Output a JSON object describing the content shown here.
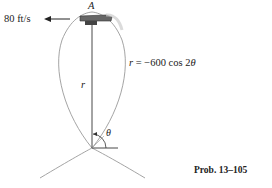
{
  "figure": {
    "velocity_label": "80 ft/s",
    "point_label": "A",
    "radius_label": "r",
    "equation": {
      "lhs": "r",
      "rhs_prefix": " = −600 cos 2",
      "rhs_var": "θ"
    },
    "angle_label": "θ",
    "caption": "Prob. 13–105"
  },
  "colors": {
    "curve": "#9a9a9a",
    "lines": "#333333",
    "plane": "#555555"
  }
}
